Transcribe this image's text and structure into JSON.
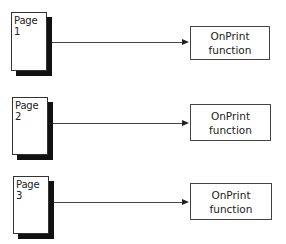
{
  "diagram": {
    "rows": [
      {
        "page_label": "Page 1",
        "func_line1": "OnPrint",
        "func_line2": "function",
        "page": {
          "x": 11,
          "y": 12,
          "w": 36,
          "h": 59
        },
        "line_y": 42,
        "func": {
          "x": 190,
          "y": 26,
          "w": 80,
          "h": 34
        }
      },
      {
        "page_label": "Page 2",
        "func_line1": "OnPrint",
        "func_line2": "function",
        "page": {
          "x": 12,
          "y": 97,
          "w": 36,
          "h": 58
        },
        "line_y": 123,
        "func": {
          "x": 190,
          "y": 104,
          "w": 81,
          "h": 37
        }
      },
      {
        "page_label": "Page 3",
        "func_line1": "OnPrint",
        "func_line2": "function",
        "page": {
          "x": 13,
          "y": 176,
          "w": 36,
          "h": 58
        },
        "line_y": 202,
        "func": {
          "x": 190,
          "y": 183,
          "w": 82,
          "h": 37
        }
      }
    ],
    "colors": {
      "shadow": "#111111",
      "line": "#444444",
      "text": "#222222"
    }
  }
}
